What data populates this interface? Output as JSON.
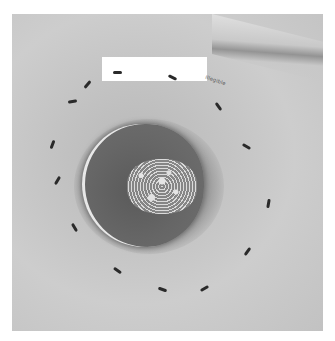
{
  "image": {
    "description": "Grayscale clinical photograph of a round open wound on skin with dark granulation tissue and white slough, surrounded by a dashed ring of ink marks",
    "redaction_box": true,
    "handwritten_label": "illegible",
    "colors": {
      "skin": "#c4c4c4",
      "wound_bed": "#5e5e5e",
      "slough": "#f0f0f0",
      "marks": "#2a2a2a",
      "border": "#ffffff"
    },
    "marks": [
      {
        "x": 117,
        "y": 72,
        "r": 0
      },
      {
        "x": 172,
        "y": 77,
        "r": 25
      },
      {
        "x": 87,
        "y": 84,
        "r": -50
      },
      {
        "x": 72,
        "y": 101,
        "r": -10
      },
      {
        "x": 218,
        "y": 106,
        "r": 55
      },
      {
        "x": 52,
        "y": 144,
        "r": -70
      },
      {
        "x": 246,
        "y": 146,
        "r": 30
      },
      {
        "x": 57,
        "y": 180,
        "r": -60
      },
      {
        "x": 268,
        "y": 203,
        "r": -80
      },
      {
        "x": 74,
        "y": 227,
        "r": 60
      },
      {
        "x": 247,
        "y": 251,
        "r": -55
      },
      {
        "x": 117,
        "y": 270,
        "r": 35
      },
      {
        "x": 162,
        "y": 289,
        "r": 20
      },
      {
        "x": 204,
        "y": 288,
        "r": -30
      }
    ]
  }
}
